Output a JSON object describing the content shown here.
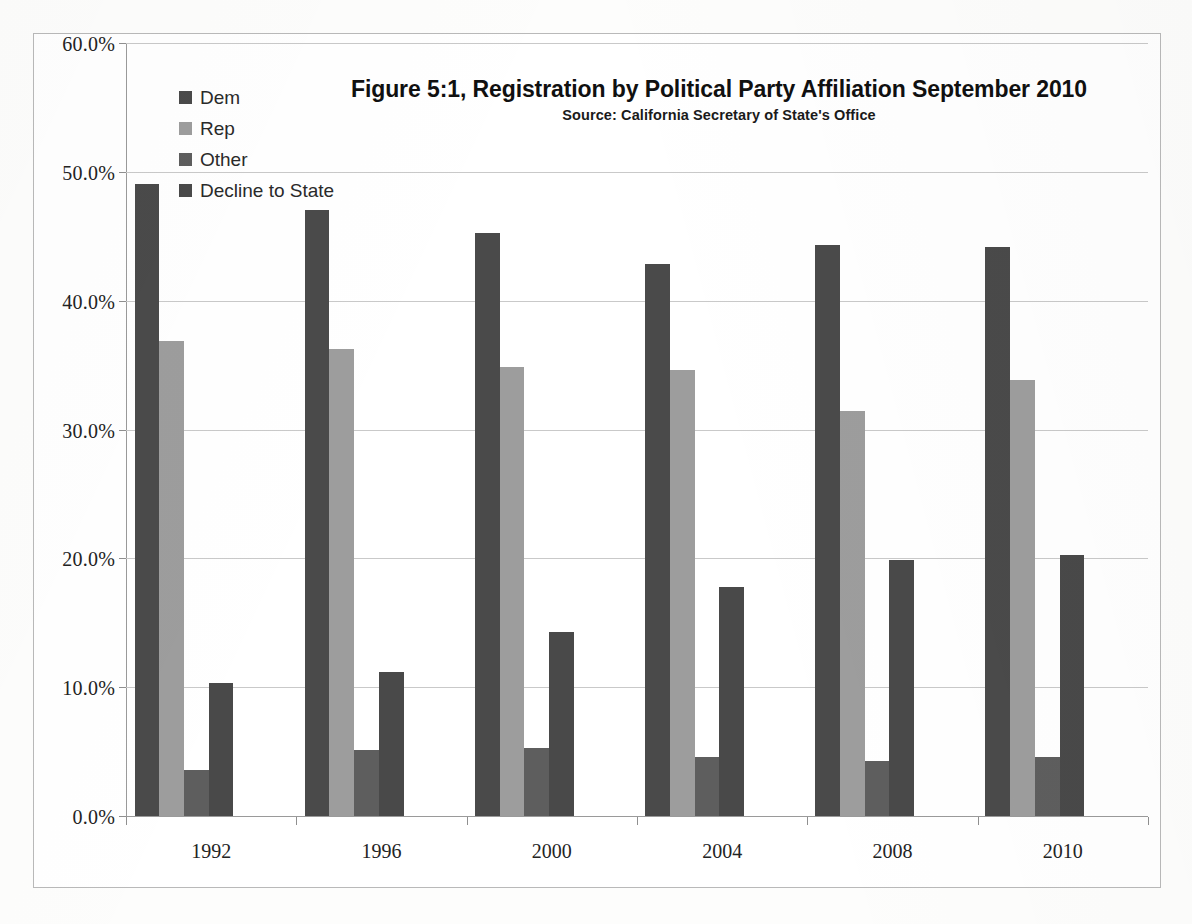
{
  "chart_data": {
    "type": "bar",
    "title": "Figure 5:1, Registration by Political Party Affiliation September 2010",
    "subtitle": "Source: California Secretary of State's Office",
    "xlabel": "",
    "ylabel": "",
    "ylim": [
      0,
      60
    ],
    "ytick_step": 10,
    "ytick_labels": [
      "0.0%",
      "10.0%",
      "20.0%",
      "30.0%",
      "40.0%",
      "50.0%",
      "60.0%"
    ],
    "ytick_values": [
      0,
      10,
      20,
      30,
      40,
      50,
      60
    ],
    "grid": true,
    "legend_position": "top-left",
    "categories": [
      "1992",
      "1996",
      "2000",
      "2004",
      "2008",
      "2010"
    ],
    "series": [
      {
        "name": "Dem",
        "color": "#4a4a4a",
        "values": [
          49.1,
          47.1,
          45.3,
          42.9,
          44.4,
          44.2
        ]
      },
      {
        "name": "Rep",
        "color": "#9d9d9d",
        "values": [
          36.9,
          36.3,
          34.9,
          34.7,
          31.5,
          33.9
        ]
      },
      {
        "name": "Other",
        "color": "#5e5e5e",
        "values": [
          3.6,
          5.1,
          5.3,
          4.6,
          4.3,
          4.6
        ]
      },
      {
        "name": "Decline to State",
        "color": "#494949",
        "values": [
          10.3,
          11.2,
          14.3,
          17.8,
          19.9,
          20.3
        ]
      }
    ]
  },
  "legend": {
    "items": [
      {
        "label": "Dem",
        "color": "#4a4a4a"
      },
      {
        "label": "Rep",
        "color": "#9d9d9d"
      },
      {
        "label": "Other",
        "color": "#5e5e5e"
      },
      {
        "label": "Decline to State",
        "color": "#494949"
      }
    ]
  },
  "colors": {
    "frame_border": "#b9b9b9",
    "gridline": "#c9c9c9",
    "axis": "#9a9a9a",
    "text": "#232323",
    "background": "#ffffff"
  }
}
